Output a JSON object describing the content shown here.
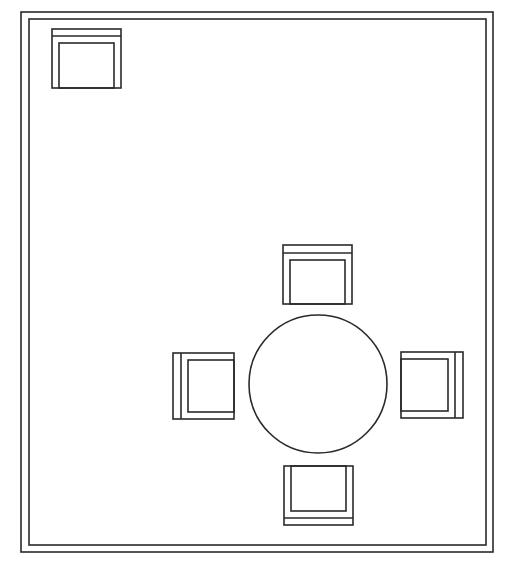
{
  "diagram": {
    "type": "floor-plan",
    "line_color": "#2a2a2a",
    "background": "#ffffff",
    "room": {
      "outer_wall": {
        "x": 21,
        "y": 12,
        "w": 472,
        "h": 540
      },
      "inner_wall": {
        "x": 29,
        "y": 19,
        "w": 457,
        "h": 526
      }
    },
    "table": {
      "shape": "circle",
      "cx": 318,
      "cy": 384,
      "r": 69
    },
    "chairs": [
      {
        "id": "armchair-corner",
        "facing": "down",
        "x": 52,
        "y": 29,
        "w": 69,
        "h": 59
      },
      {
        "id": "chair-north",
        "facing": "down",
        "x": 283,
        "y": 245,
        "w": 69,
        "h": 59
      },
      {
        "id": "chair-west",
        "facing": "right",
        "x": 173,
        "y": 353,
        "w": 61,
        "h": 66
      },
      {
        "id": "chair-east",
        "facing": "left",
        "x": 401,
        "y": 352,
        "w": 62,
        "h": 66
      },
      {
        "id": "chair-south",
        "facing": "up",
        "x": 284,
        "y": 466,
        "w": 69,
        "h": 59
      }
    ]
  }
}
